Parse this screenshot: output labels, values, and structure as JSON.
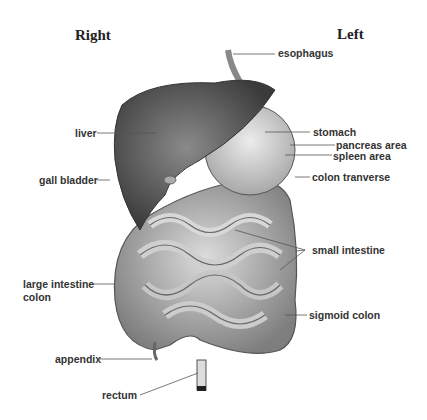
{
  "diagram": {
    "orientation": {
      "right_heading": "Right",
      "left_heading": "Left"
    },
    "labels": {
      "esophagus": "esophagus",
      "liver": "liver",
      "stomach": "stomach",
      "pancreas": "pancreas area",
      "spleen": "spleen area",
      "gall_bladder": "gall bladder",
      "colon_transverse": "colon tranverse",
      "small_intestine": "small intestine",
      "large_intestine_1": "large intestine",
      "large_intestine_2": "colon",
      "sigmoid_colon": "sigmoid colon",
      "appendix": "appendix",
      "rectum": "rectum"
    },
    "colors": {
      "liver": "#4a4a4a",
      "stomach": "#cfcfcf",
      "intestine": "#bdbdbd",
      "outline": "#555555",
      "leader": "#555555"
    }
  }
}
